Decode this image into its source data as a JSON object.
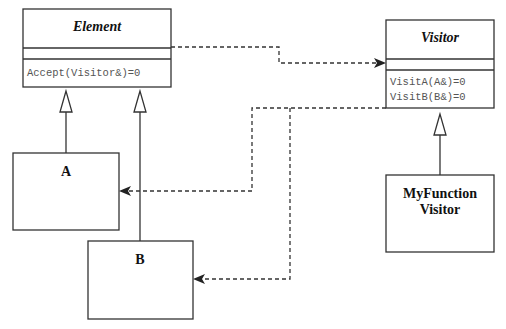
{
  "diagram": {
    "type": "UML class diagram - Visitor pattern",
    "classes": {
      "element": {
        "name": "Element",
        "abstract": true,
        "attributes": [],
        "methods": [
          "Accept(Visitor&)=0"
        ]
      },
      "visitor": {
        "name": "Visitor",
        "abstract": true,
        "attributes": [],
        "methods": [
          "VisitA(A&)=0",
          "VisitB(B&)=0"
        ]
      },
      "a": {
        "name": "A",
        "abstract": false
      },
      "b": {
        "name": "B",
        "abstract": false
      },
      "my_function_visitor": {
        "name_line1": "MyFunction",
        "name_line2": "Visitor",
        "abstract": false
      }
    },
    "relationships": [
      {
        "type": "generalization",
        "from": "A",
        "to": "Element"
      },
      {
        "type": "generalization",
        "from": "B",
        "to": "Element"
      },
      {
        "type": "generalization",
        "from": "MyFunctionVisitor",
        "to": "Visitor"
      },
      {
        "type": "dependency",
        "from": "Element",
        "to": "Visitor"
      },
      {
        "type": "dependency",
        "from": "Visitor",
        "to": "A"
      },
      {
        "type": "dependency",
        "from": "Visitor",
        "to": "B"
      }
    ],
    "colors": {
      "line": "#333333",
      "background": "#ffffff",
      "method_text": "#555555"
    }
  }
}
